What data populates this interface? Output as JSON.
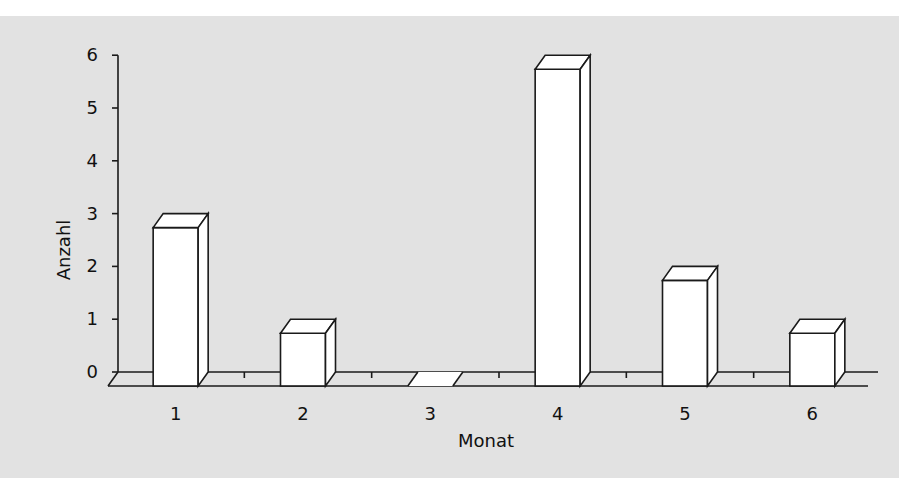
{
  "chart_data": {
    "type": "bar",
    "style": "3d-column",
    "title": "",
    "xlabel": "Monat",
    "ylabel": "Anzahl",
    "categories": [
      "1",
      "2",
      "3",
      "4",
      "5",
      "6"
    ],
    "values": [
      3,
      1,
      0,
      6,
      2,
      1
    ],
    "ylim": [
      0,
      6
    ],
    "yticks": [
      "0",
      "1",
      "2",
      "3",
      "4",
      "5",
      "6"
    ],
    "grid": false,
    "legend": null,
    "colors": {
      "bar_fill": "#ffffff",
      "bar_stroke": "#1a1a1a",
      "background": "#e2e2e2"
    }
  }
}
